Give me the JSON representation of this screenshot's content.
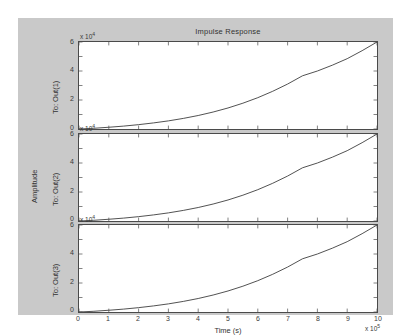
{
  "figure": {
    "title": "Impulse Response",
    "xlabel": "Time (s)",
    "ylabel": "Amplitude",
    "x_exponent_prefix": "x 10",
    "x_exponent": "5",
    "y_exponent_prefix": "x 10",
    "y_exponent": "4"
  },
  "panels": [
    {
      "ylabel": "To: Out(1)",
      "exp_prefix": "x 10",
      "exp": "4"
    },
    {
      "ylabel": "To: Out(2)",
      "exp_prefix": "x 10",
      "exp": "4"
    },
    {
      "ylabel": "To: Out(3)",
      "exp_prefix": "x 10",
      "exp": "4"
    }
  ],
  "yticks": [
    "0",
    "2",
    "4",
    "6"
  ],
  "xticks": [
    "0",
    "1",
    "2",
    "3",
    "4",
    "5",
    "6",
    "7",
    "8",
    "9",
    "10"
  ],
  "colors": {
    "figure_background": "#c9c9c9",
    "axes_background": "#ffffff",
    "axis_line": "#4a4a4a",
    "curve": "#3c3c3c",
    "text": "#333333"
  },
  "chart_data": {
    "type": "line",
    "title": "Impulse Response",
    "xlabel": "Time (s)",
    "ylabel": "Amplitude",
    "x_scale_factor": 100000,
    "y_scale_factor": 10000,
    "xlim": [
      0,
      10
    ],
    "ylim": [
      0,
      6
    ],
    "grid": false,
    "legend": null,
    "x": [
      0,
      0.5,
      1,
      1.5,
      2,
      2.5,
      3,
      3.5,
      4,
      4.5,
      5,
      5.5,
      6,
      6.5,
      7,
      7.5,
      8,
      8.5,
      9,
      9.5,
      10
    ],
    "series": [
      {
        "name": "To: Out(1)",
        "values": [
          0,
          0.05,
          0.12,
          0.2,
          0.3,
          0.42,
          0.56,
          0.73,
          0.93,
          1.17,
          1.45,
          1.78,
          2.16,
          2.6,
          3.1,
          3.67,
          4.0,
          4.4,
          4.85,
          5.4,
          6.0
        ]
      },
      {
        "name": "To: Out(2)",
        "values": [
          0,
          0.05,
          0.12,
          0.2,
          0.3,
          0.42,
          0.56,
          0.73,
          0.93,
          1.17,
          1.45,
          1.78,
          2.16,
          2.6,
          3.1,
          3.67,
          4.0,
          4.4,
          4.85,
          5.4,
          6.0
        ]
      },
      {
        "name": "To: Out(3)",
        "values": [
          0,
          0.05,
          0.12,
          0.2,
          0.3,
          0.42,
          0.56,
          0.73,
          0.93,
          1.17,
          1.45,
          1.78,
          2.16,
          2.6,
          3.1,
          3.67,
          4.0,
          4.4,
          4.85,
          5.4,
          6.0
        ]
      }
    ]
  }
}
